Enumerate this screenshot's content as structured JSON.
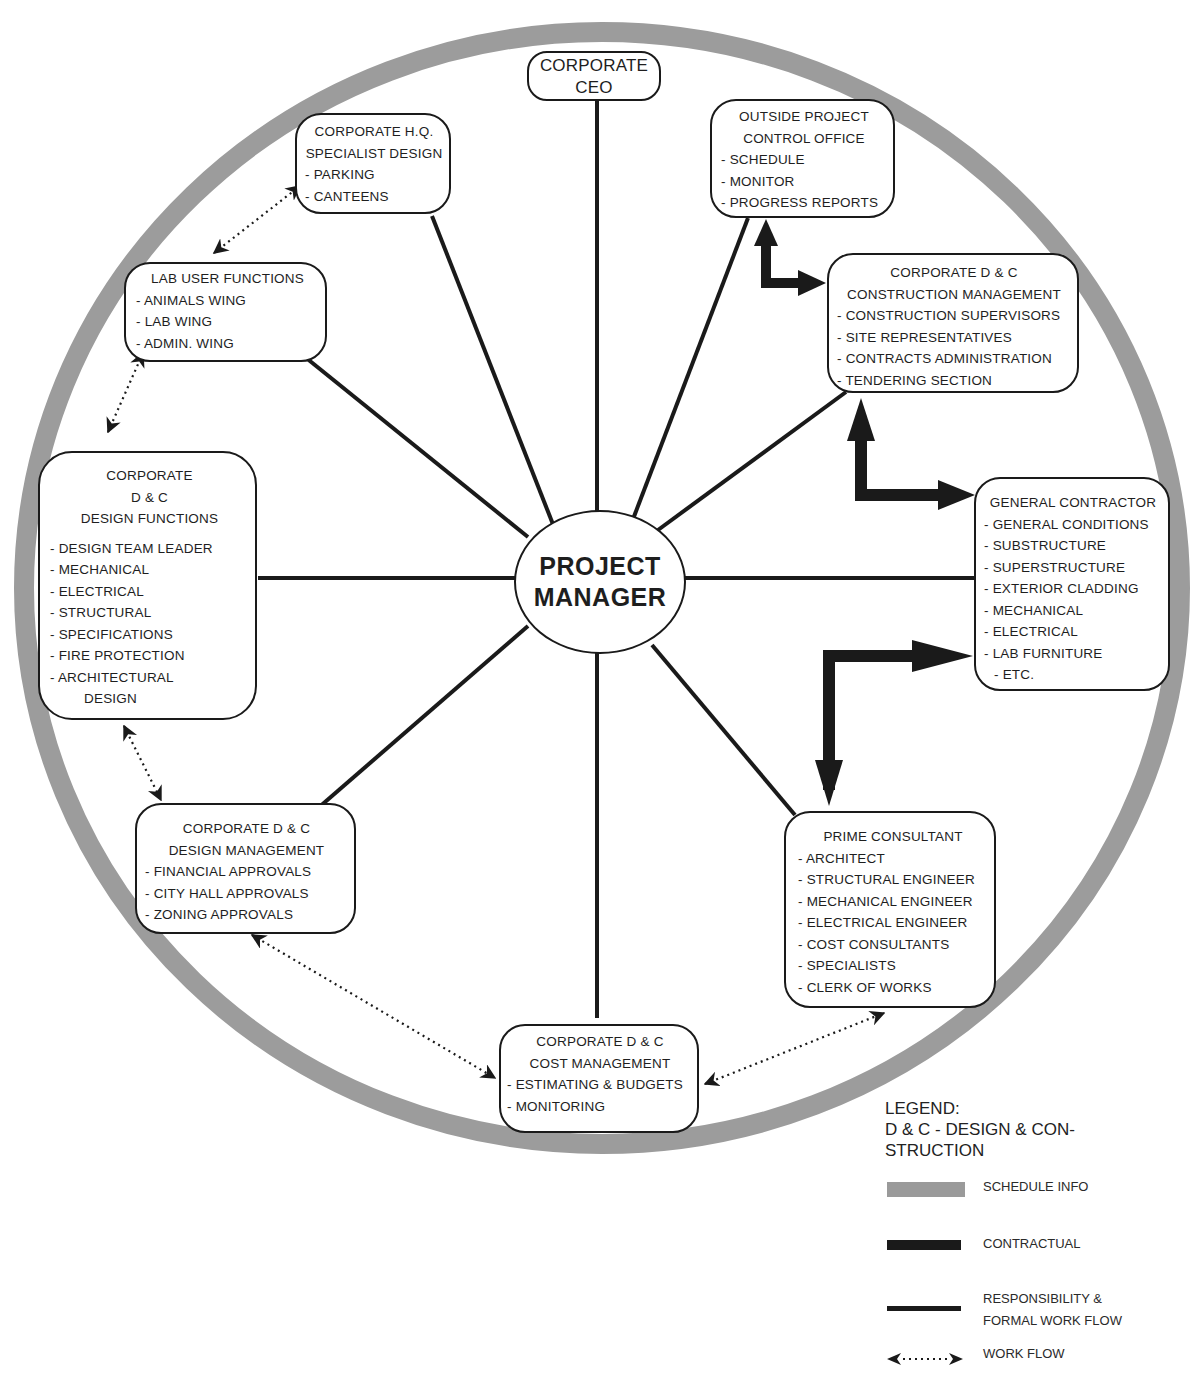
{
  "diagram": {
    "center": {
      "line1": "PROJECT",
      "line2": "MANAGER"
    },
    "ceo": {
      "line1": "CORPORATE",
      "line2": "CEO"
    },
    "hq_design": {
      "title_line1": "CORPORATE H.Q.",
      "title_line2": "SPECIALIST DESIGN",
      "items": [
        "PARKING",
        "CANTEENS"
      ]
    },
    "project_control": {
      "title_line1": "OUTSIDE PROJECT",
      "title_line2": "CONTROL OFFICE",
      "items": [
        "SCHEDULE",
        "MONITOR",
        "PROGRESS REPORTS"
      ]
    },
    "construction_mgmt": {
      "title_line1": "CORPORATE D & C",
      "title_line2": "CONSTRUCTION MANAGEMENT",
      "items": [
        "CONSTRUCTION SUPERVISORS",
        "SITE REPRESENTATIVES",
        "CONTRACTS ADMINISTRATION",
        "TENDERING SECTION"
      ]
    },
    "general_contractor": {
      "title": "GENERAL CONTRACTOR",
      "items": [
        "GENERAL CONDITIONS",
        "SUBSTRUCTURE",
        "SUPERSTRUCTURE",
        "EXTERIOR CLADDING",
        "MECHANICAL",
        "ELECTRICAL",
        "LAB FURNITURE",
        "ETC."
      ]
    },
    "prime_consultant": {
      "title": "PRIME CONSULTANT",
      "items": [
        "ARCHITECT",
        "STRUCTURAL ENGINEER",
        "MECHANICAL ENGINEER",
        "ELECTRICAL ENGINEER",
        "COST CONSULTANTS",
        "SPECIALISTS",
        "CLERK OF WORKS"
      ]
    },
    "cost_mgmt": {
      "title_line1": "CORPORATE D & C",
      "title_line2": "COST MANAGEMENT",
      "items": [
        "ESTIMATING & BUDGETS",
        "MONITORING"
      ]
    },
    "design_mgmt": {
      "title_line1": "CORPORATE D & C",
      "title_line2": "DESIGN MANAGEMENT",
      "items": [
        "FINANCIAL APPROVALS",
        "CITY HALL APPROVALS",
        "ZONING APPROVALS"
      ]
    },
    "design_functions": {
      "title_line1": "CORPORATE",
      "title_line2": "D & C",
      "title_line3": "DESIGN FUNCTIONS",
      "items": [
        "DESIGN TEAM LEADER",
        "MECHANICAL",
        "ELECTRICAL",
        "STRUCTURAL",
        "SPECIFICATIONS",
        "FIRE PROTECTION",
        "ARCHITECTURAL",
        "DESIGN"
      ]
    },
    "lab_user": {
      "title": "LAB USER FUNCTIONS",
      "items": [
        "ANIMALS WING",
        "LAB WING",
        "ADMIN. WING"
      ]
    }
  },
  "legend": {
    "heading": "LEGEND:",
    "definition_line1": "D & C - DESIGN & CON-",
    "definition_line2": "STRUCTION",
    "items": [
      {
        "label_line1": "SCHEDULE INFO",
        "label_line2": "",
        "style": "schedule-info",
        "color": "#9a9a9a"
      },
      {
        "label_line1": "CONTRACTUAL",
        "label_line2": "",
        "style": "contractual",
        "color": "#1a1a1a"
      },
      {
        "label_line1": "RESPONSIBILITY &",
        "label_line2": "FORMAL WORK FLOW",
        "style": "responsibility",
        "color": "#1a1a1a"
      },
      {
        "label_line1": "WORK FLOW",
        "label_line2": "",
        "style": "work-flow-dotted",
        "color": "#1a1a1a"
      }
    ]
  },
  "colors": {
    "ring": "#9c9c9c",
    "line": "#1a1a1a",
    "box_border": "#1a1a1a",
    "background": "#ffffff"
  }
}
